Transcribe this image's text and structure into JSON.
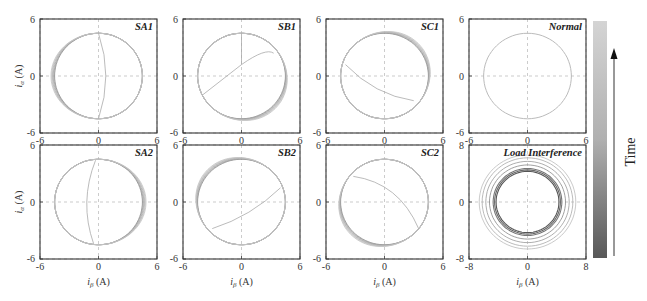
{
  "figure": {
    "colorbar_label": "Time",
    "x_axis_label": "iβ (A)",
    "y_axis_label": "iα (A)",
    "colorbar_top_color": "#d0d0d0",
    "colorbar_bottom_color": "#555555"
  },
  "chart_data": [
    {
      "type": "line",
      "title": "SA1",
      "xlabel": "",
      "ylabel": "iα (A)",
      "xlim": [
        -6,
        6
      ],
      "ylim": [
        -6,
        6
      ],
      "xticks": [
        -6,
        0,
        6
      ],
      "yticks": [
        -6,
        0,
        6
      ],
      "grid": true,
      "description": "Circle radius ~4.5 with trajectories progressively shifted left (deformed toward -6 on left side), vertical transient curve near iβ≈0"
    },
    {
      "type": "line",
      "title": "SB1",
      "xlabel": "",
      "ylabel": "",
      "xlim": [
        -6,
        6
      ],
      "ylim": [
        -6,
        6
      ],
      "xticks": [
        -6,
        0,
        6
      ],
      "yticks": [
        -6,
        0,
        6
      ],
      "grid": true,
      "description": "Circle radius ~4.5 with trajectories expanding to lower-right; oscillating transient from center to left"
    },
    {
      "type": "line",
      "title": "SC1",
      "xlabel": "",
      "ylabel": "",
      "xlim": [
        -6,
        6
      ],
      "ylim": [
        -6,
        6
      ],
      "xticks": [
        -6,
        0,
        6
      ],
      "yticks": [
        -6,
        0,
        6
      ],
      "grid": true,
      "description": "Circle radius ~4.5 with trajectories expanding to upper-right; diagonal transient"
    },
    {
      "type": "line",
      "title": "Normal",
      "xlabel": "",
      "ylabel": "",
      "xlim": [
        -6,
        6
      ],
      "ylim": [
        -6,
        6
      ],
      "xticks": [
        -6,
        0,
        6
      ],
      "yticks": [
        -6,
        0,
        6
      ],
      "grid": true,
      "description": "Single circle radius ~4.5 centered at origin"
    },
    {
      "type": "line",
      "title": "SA2",
      "xlabel": "iβ (A)",
      "ylabel": "iα (A)",
      "xlim": [
        -6,
        6
      ],
      "ylim": [
        -6,
        6
      ],
      "xticks": [
        -6,
        0,
        6
      ],
      "yticks": [
        -6,
        0,
        6
      ],
      "grid": true,
      "description": "Circle radius ~4.5 with trajectories shifted right"
    },
    {
      "type": "line",
      "title": "SB2",
      "xlabel": "iβ (A)",
      "ylabel": "",
      "xlim": [
        -6,
        6
      ],
      "ylim": [
        -6,
        6
      ],
      "xticks": [
        -6,
        0,
        6
      ],
      "yticks": [
        -6,
        0,
        6
      ],
      "grid": true,
      "description": "Circle radius ~4.5 with trajectories expanding to upper-left"
    },
    {
      "type": "line",
      "title": "SC2",
      "xlabel": "iβ (A)",
      "ylabel": "",
      "xlim": [
        -6,
        6
      ],
      "ylim": [
        -6,
        6
      ],
      "xticks": [
        -6,
        0,
        6
      ],
      "yticks": [
        -6,
        0,
        6
      ],
      "grid": true,
      "description": "Circle radius ~4.5 with trajectories expanding to lower-left"
    },
    {
      "type": "line",
      "title": "Load Interference",
      "xlabel": "iβ (A)",
      "ylabel": "",
      "xlim": [
        -8,
        8
      ],
      "ylim": [
        -8,
        8
      ],
      "xticks": [
        -8,
        0,
        8
      ],
      "yticks": [
        -8,
        0,
        8
      ],
      "grid": true,
      "description": "Concentric circles with radii from ~4.3 to ~6.6, growing over time"
    }
  ],
  "panels": [
    {
      "title": "SA1",
      "xmin": "-6",
      "xmid": "0",
      "xmax": "6",
      "ymin": "-6",
      "ymid": "0",
      "ymax": "6"
    },
    {
      "title": "SB1",
      "xmin": "-6",
      "xmid": "0",
      "xmax": "6",
      "ymin": "-6",
      "ymid": "0",
      "ymax": "6"
    },
    {
      "title": "SC1",
      "xmin": "-6",
      "xmid": "0",
      "xmax": "6",
      "ymin": "-6",
      "ymid": "0",
      "ymax": "6"
    },
    {
      "title": "Normal",
      "xmin": "-6",
      "xmid": "0",
      "xmax": "6",
      "ymin": "-6",
      "ymid": "0",
      "ymax": "6"
    },
    {
      "title": "SA2",
      "xmin": "-6",
      "xmid": "0",
      "xmax": "6",
      "ymin": "-6",
      "ymid": "0",
      "ymax": "6"
    },
    {
      "title": "SB2",
      "xmin": "-6",
      "xmid": "0",
      "xmax": "6",
      "ymin": "-6",
      "ymid": "0",
      "ymax": "6"
    },
    {
      "title": "SC2",
      "xmin": "-6",
      "xmid": "0",
      "xmax": "6",
      "ymin": "-6",
      "ymid": "0",
      "ymax": "6"
    },
    {
      "title": "Load Interference",
      "xmin": "-8",
      "xmid": "0",
      "xmax": "8",
      "ymin": "-8",
      "ymid": "0",
      "ymax": "8"
    }
  ],
  "axis_labels": {
    "x": "i",
    "x_sub": "β",
    "y": "i",
    "y_sub": "α",
    "unit": "(A)"
  }
}
